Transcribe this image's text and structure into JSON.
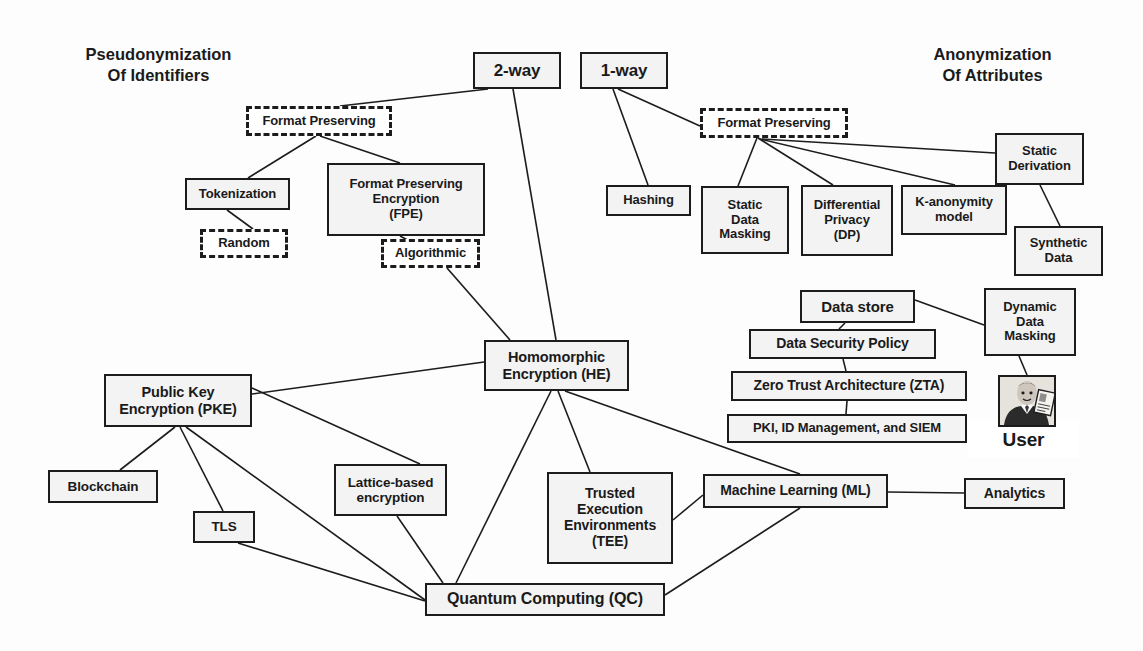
{
  "diagram": {
    "title_left_line1": "Pseudonymization",
    "title_left_line2": "Of Identifiers",
    "title_right_line1": "Anonymization",
    "title_right_line2": "Of Attributes",
    "colors": {
      "stroke": "#1c1c1c",
      "node_fill": "#f3f3f3",
      "white_fill": "#ffffff",
      "background": "#fdfdfd",
      "text": "#1a1a1a"
    },
    "nodes": [
      {
        "id": "two_way",
        "label": "2-way",
        "style": "solid",
        "x": 473,
        "y": 52,
        "w": 88,
        "h": 37,
        "fs": 17
      },
      {
        "id": "one_way",
        "label": "1-way",
        "style": "solid",
        "x": 580,
        "y": 52,
        "w": 88,
        "h": 37,
        "fs": 17
      },
      {
        "id": "fp_left",
        "label": "Format Preserving",
        "style": "dashed",
        "x": 246,
        "y": 106,
        "w": 146,
        "h": 30,
        "fs": 13
      },
      {
        "id": "fp_right",
        "label": "Format Preserving",
        "style": "dashed",
        "x": 700,
        "y": 108,
        "w": 148,
        "h": 30,
        "fs": 13
      },
      {
        "id": "tokenization",
        "label": "Tokenization",
        "style": "solid",
        "x": 185,
        "y": 178,
        "w": 105,
        "h": 32,
        "fs": 13
      },
      {
        "id": "random",
        "label": "Random",
        "style": "dashed",
        "x": 200,
        "y": 229,
        "w": 88,
        "h": 29,
        "fs": 13
      },
      {
        "id": "fpe",
        "label": "Format Preserving\nEncryption\n(FPE)",
        "style": "solid",
        "x": 327,
        "y": 163,
        "w": 158,
        "h": 73,
        "fs": 13
      },
      {
        "id": "algorithmic",
        "label": "Algorithmic",
        "style": "dashed",
        "x": 381,
        "y": 239,
        "w": 99,
        "h": 29,
        "fs": 13
      },
      {
        "id": "hashing",
        "label": "Hashing",
        "style": "solid",
        "x": 606,
        "y": 185,
        "w": 85,
        "h": 31,
        "fs": 13
      },
      {
        "id": "sdm",
        "label": "Static\nData\nMasking",
        "style": "solid",
        "x": 701,
        "y": 186,
        "w": 88,
        "h": 68,
        "fs": 13
      },
      {
        "id": "dp",
        "label": "Differential\nPrivacy\n(DP)",
        "style": "solid",
        "x": 801,
        "y": 185,
        "w": 92,
        "h": 71,
        "fs": 13
      },
      {
        "id": "kanon",
        "label": "K-anonymity\nmodel",
        "style": "solid",
        "x": 901,
        "y": 185,
        "w": 106,
        "h": 50,
        "fs": 13
      },
      {
        "id": "static_deriv",
        "label": "Static\nDerivation",
        "style": "solid",
        "x": 995,
        "y": 133,
        "w": 89,
        "h": 52,
        "fs": 13
      },
      {
        "id": "synthetic",
        "label": "Synthetic\nData",
        "style": "solid",
        "x": 1014,
        "y": 226,
        "w": 89,
        "h": 50,
        "fs": 13
      },
      {
        "id": "data_store",
        "label": "Data store",
        "style": "solid",
        "x": 800,
        "y": 290,
        "w": 115,
        "h": 33,
        "fs": 15
      },
      {
        "id": "dsp",
        "label": "Data Security Policy",
        "style": "solid",
        "x": 749,
        "y": 329,
        "w": 187,
        "h": 30,
        "fs": 14
      },
      {
        "id": "zta",
        "label": "Zero Trust Architecture (ZTA)",
        "style": "solid",
        "x": 731,
        "y": 371,
        "w": 236,
        "h": 30,
        "fs": 14
      },
      {
        "id": "pki",
        "label": "PKI, ID Management, and SIEM",
        "style": "solid",
        "x": 727,
        "y": 414,
        "w": 240,
        "h": 29,
        "fs": 13
      },
      {
        "id": "ddm",
        "label": "Dynamic\nData\nMasking",
        "style": "solid",
        "x": 984,
        "y": 288,
        "w": 92,
        "h": 68,
        "fs": 13
      },
      {
        "id": "user",
        "label": "User",
        "style": "white",
        "x": 968,
        "y": 421,
        "w": 111,
        "h": 37,
        "fs": 19
      },
      {
        "id": "he",
        "label": "Homomorphic\nEncryption (HE)",
        "style": "solid",
        "x": 484,
        "y": 340,
        "w": 145,
        "h": 51,
        "fs": 14.5
      },
      {
        "id": "pke",
        "label": "Public Key\nEncryption (PKE)",
        "style": "solid",
        "x": 104,
        "y": 374,
        "w": 148,
        "h": 53,
        "fs": 14.5
      },
      {
        "id": "blockchain",
        "label": "Blockchain",
        "style": "solid",
        "x": 48,
        "y": 470,
        "w": 110,
        "h": 33,
        "fs": 13.5
      },
      {
        "id": "tls",
        "label": "TLS",
        "style": "solid",
        "x": 193,
        "y": 511,
        "w": 62,
        "h": 32,
        "fs": 13.5
      },
      {
        "id": "lattice",
        "label": "Lattice-based\nencryption",
        "style": "solid",
        "x": 334,
        "y": 464,
        "w": 113,
        "h": 52,
        "fs": 13.5
      },
      {
        "id": "tee",
        "label": "Trusted\nExecution\nEnvironments\n(TEE)",
        "style": "solid",
        "x": 547,
        "y": 472,
        "w": 126,
        "h": 92,
        "fs": 14
      },
      {
        "id": "ml",
        "label": "Machine Learning (ML)",
        "style": "solid",
        "x": 703,
        "y": 474,
        "w": 185,
        "h": 34,
        "fs": 14
      },
      {
        "id": "analytics",
        "label": "Analytics",
        "style": "solid",
        "x": 964,
        "y": 478,
        "w": 101,
        "h": 31,
        "fs": 14
      },
      {
        "id": "qc",
        "label": "Quantum Computing (QC)",
        "style": "solid",
        "x": 425,
        "y": 583,
        "w": 240,
        "h": 33,
        "fs": 16
      }
    ],
    "edges": [
      {
        "from": "two_way",
        "to": "fp_left",
        "x1": 488,
        "y1": 89,
        "x2": 340,
        "y2": 106
      },
      {
        "from": "two_way",
        "to": "he",
        "x1": 513,
        "y1": 89,
        "x2": 556,
        "y2": 340
      },
      {
        "from": "one_way",
        "to": "hashing",
        "x1": 613,
        "y1": 89,
        "x2": 648,
        "y2": 185
      },
      {
        "from": "one_way",
        "to": "fp_right",
        "x1": 618,
        "y1": 89,
        "x2": 700,
        "y2": 126
      },
      {
        "from": "fp_left",
        "to": "tokenization",
        "x1": 316,
        "y1": 136,
        "x2": 248,
        "y2": 178
      },
      {
        "from": "fp_left",
        "to": "fpe",
        "x1": 320,
        "y1": 136,
        "x2": 400,
        "y2": 163
      },
      {
        "from": "tokenization",
        "to": "random",
        "x1": 227,
        "y1": 210,
        "x2": 253,
        "y2": 229
      },
      {
        "from": "fpe",
        "to": "algorithmic",
        "x1": 400,
        "y1": 236,
        "x2": 434,
        "y2": 254
      },
      {
        "from": "algorithmic",
        "to": "he",
        "x1": 447,
        "y1": 268,
        "x2": 510,
        "y2": 340
      },
      {
        "from": "fp_right",
        "to": "sdm",
        "x1": 757,
        "y1": 138,
        "x2": 738,
        "y2": 186
      },
      {
        "from": "fp_right",
        "to": "dp",
        "x1": 758,
        "y1": 138,
        "x2": 833,
        "y2": 185
      },
      {
        "from": "fp_right",
        "to": "kanon",
        "x1": 760,
        "y1": 139,
        "x2": 955,
        "y2": 185
      },
      {
        "from": "fp_right",
        "to": "static_deriv",
        "x1": 762,
        "y1": 139,
        "x2": 995,
        "y2": 153
      },
      {
        "from": "static_deriv",
        "to": "synthetic",
        "x1": 1040,
        "y1": 185,
        "x2": 1060,
        "y2": 226
      },
      {
        "from": "data_store",
        "to": "dsp",
        "x1": 845,
        "y1": 323,
        "x2": 839,
        "y2": 329
      },
      {
        "from": "data_store",
        "to": "ddm",
        "x1": 915,
        "y1": 300,
        "x2": 984,
        "y2": 325
      },
      {
        "from": "dsp",
        "to": "zta",
        "x1": 843,
        "y1": 359,
        "x2": 846,
        "y2": 371
      },
      {
        "from": "zta",
        "to": "pki",
        "x1": 847,
        "y1": 401,
        "x2": 846,
        "y2": 414
      },
      {
        "from": "ddm",
        "to": "user_photo",
        "x1": 1019,
        "y1": 356,
        "x2": 1027,
        "y2": 375
      },
      {
        "from": "he",
        "to": "pke",
        "x1": 484,
        "y1": 362,
        "x2": 252,
        "y2": 394
      },
      {
        "from": "he",
        "to": "qc",
        "x1": 551,
        "y1": 391,
        "x2": 456,
        "y2": 583
      },
      {
        "from": "he",
        "to": "tee",
        "x1": 558,
        "y1": 391,
        "x2": 590,
        "y2": 472
      },
      {
        "from": "he",
        "to": "ml",
        "x1": 565,
        "y1": 391,
        "x2": 800,
        "y2": 474
      },
      {
        "from": "pke",
        "to": "blockchain",
        "x1": 175,
        "y1": 427,
        "x2": 120,
        "y2": 470
      },
      {
        "from": "pke",
        "to": "tls",
        "x1": 180,
        "y1": 427,
        "x2": 223,
        "y2": 511
      },
      {
        "from": "pke",
        "to": "qc",
        "x1": 186,
        "y1": 427,
        "x2": 425,
        "y2": 600
      },
      {
        "from": "pke",
        "to": "lattice",
        "x1": 252,
        "y1": 388,
        "x2": 420,
        "y2": 464
      },
      {
        "from": "tls",
        "to": "qc",
        "x1": 238,
        "y1": 543,
        "x2": 425,
        "y2": 601
      },
      {
        "from": "lattice",
        "to": "qc",
        "x1": 397,
        "y1": 516,
        "x2": 443,
        "y2": 583
      },
      {
        "from": "tee",
        "to": "ml",
        "x1": 673,
        "y1": 520,
        "x2": 703,
        "y2": 495
      },
      {
        "from": "ml",
        "to": "qc",
        "x1": 800,
        "y1": 508,
        "x2": 665,
        "y2": 595
      },
      {
        "from": "ml",
        "to": "analytics",
        "x1": 888,
        "y1": 492,
        "x2": 964,
        "y2": 493
      }
    ],
    "icons": {
      "user_photo": "user-photo-icon"
    }
  }
}
